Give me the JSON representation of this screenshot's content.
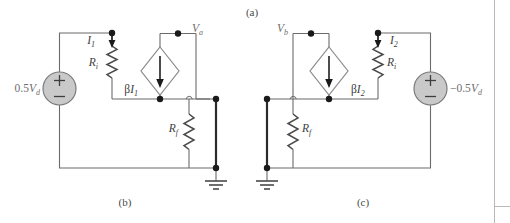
{
  "figure": {
    "top_caption": "(a)",
    "captions": [
      {
        "id": "caption-b",
        "text": "(b)"
      },
      {
        "id": "caption-c",
        "text": "(c)"
      }
    ],
    "colors": {
      "wire": "#6b6b6b",
      "wire_highlight": "#2b2b2b",
      "node": "#1a1a1a",
      "source_fill": "#c9c9c9",
      "source_stroke": "#7a7a7a",
      "diamond_fill": "#ffffff",
      "diamond_stroke": "#8a8a8a",
      "label_text": "#6e6e6e",
      "caption_text": "#4a4a4a",
      "frame_line": "#b9b9b9"
    }
  },
  "circuit_b": {
    "name": "circuit-b",
    "independent_source": {
      "label_main": "0.5",
      "label_var": "V",
      "label_sub": "d",
      "plus": "+",
      "minus": "−"
    },
    "current_label": {
      "var": "I",
      "sub": "1"
    },
    "input_resistor": {
      "var": "R",
      "sub": "i"
    },
    "feedback_resistor": {
      "var": "R",
      "sub": "f"
    },
    "dependent_source": {
      "beta": "β",
      "var": "I",
      "sub": "1"
    },
    "node_voltage": {
      "var": "V",
      "sub": "a"
    }
  },
  "circuit_c": {
    "name": "circuit-c",
    "independent_source": {
      "label_main": "−0.5",
      "label_var": "V",
      "label_sub": "d",
      "plus": "+",
      "minus": "−"
    },
    "current_label": {
      "var": "I",
      "sub": "2"
    },
    "input_resistor": {
      "var": "R",
      "sub": "i"
    },
    "feedback_resistor": {
      "var": "R",
      "sub": "f"
    },
    "dependent_source": {
      "beta": "β",
      "var": "I",
      "sub": "2"
    },
    "node_voltage": {
      "var": "V",
      "sub": "b"
    }
  }
}
